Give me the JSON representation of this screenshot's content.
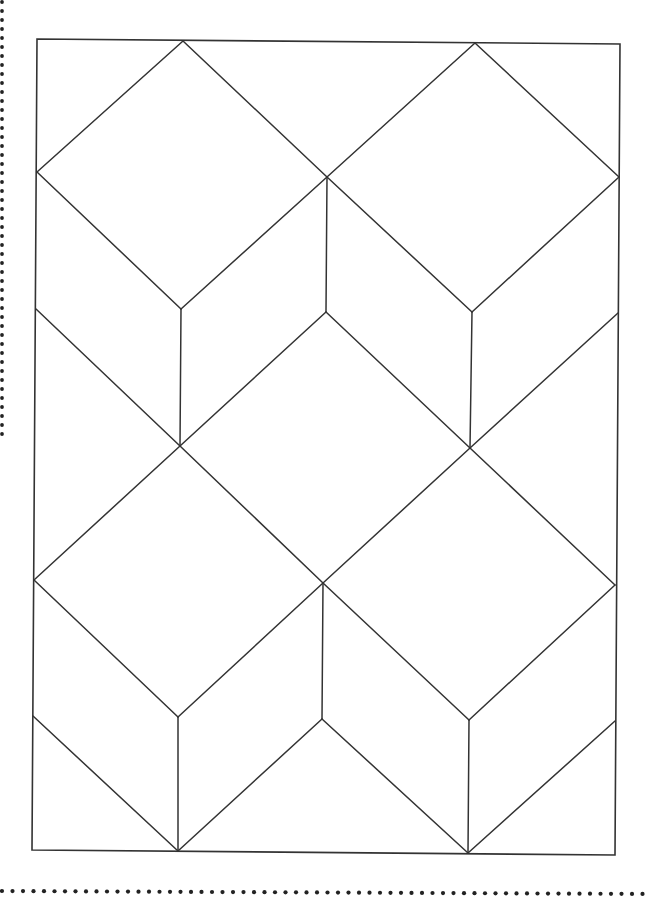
{
  "diagram": {
    "title": "Tumbling blocks quilt pattern",
    "type": "geometric-line-drawing",
    "stroke_color": "#333333",
    "dot_color": "#222222",
    "background": "#ffffff",
    "frame": {
      "top_left": [
        37,
        39
      ],
      "top_right": [
        620,
        44
      ],
      "bottom_right": [
        615,
        855
      ],
      "bottom_left": [
        32,
        850
      ]
    },
    "cube_count": 5,
    "cut_lines": {
      "left_dotted_edge": {
        "x": 2,
        "y_start": 2,
        "y_end": 440,
        "spacing": 9
      },
      "bottom_dotted_edge": {
        "y": 891,
        "x_start": 2,
        "x_end": 648,
        "spacing": 10.5
      }
    },
    "segments": [
      [
        [
          183,
          41
        ],
        [
          37,
          172
        ]
      ],
      [
        [
          183,
          41
        ],
        [
          327,
          177
        ]
      ],
      [
        [
          475,
          43
        ],
        [
          327,
          177
        ]
      ],
      [
        [
          475,
          43
        ],
        [
          619,
          177
        ]
      ],
      [
        [
          37,
          172
        ],
        [
          181,
          309
        ]
      ],
      [
        [
          327,
          177
        ],
        [
          181,
          309
        ]
      ],
      [
        [
          327,
          177
        ],
        [
          472,
          312
        ]
      ],
      [
        [
          619,
          177
        ],
        [
          472,
          312
        ]
      ],
      [
        [
          327,
          177
        ],
        [
          326,
          312
        ]
      ],
      [
        [
          181,
          309
        ],
        [
          180,
          446
        ]
      ],
      [
        [
          472,
          312
        ],
        [
          470,
          448
        ]
      ],
      [
        [
          36,
          309
        ],
        [
          180,
          446
        ]
      ],
      [
        [
          326,
          312
        ],
        [
          180,
          446
        ]
      ],
      [
        [
          326,
          312
        ],
        [
          470,
          448
        ]
      ],
      [
        [
          618,
          313
        ],
        [
          470,
          448
        ]
      ],
      [
        [
          180,
          446
        ],
        [
          34,
          580
        ]
      ],
      [
        [
          180,
          446
        ],
        [
          323,
          583
        ]
      ],
      [
        [
          470,
          448
        ],
        [
          323,
          583
        ]
      ],
      [
        [
          470,
          448
        ],
        [
          615,
          585
        ]
      ],
      [
        [
          34,
          580
        ],
        [
          178,
          717
        ]
      ],
      [
        [
          323,
          583
        ],
        [
          178,
          717
        ]
      ],
      [
        [
          323,
          583
        ],
        [
          469,
          720
        ]
      ],
      [
        [
          615,
          585
        ],
        [
          469,
          720
        ]
      ],
      [
        [
          323,
          583
        ],
        [
          322,
          719
        ]
      ],
      [
        [
          178,
          717
        ],
        [
          178,
          851
        ]
      ],
      [
        [
          469,
          720
        ],
        [
          468,
          853
        ]
      ],
      [
        [
          33,
          716
        ],
        [
          178,
          851
        ]
      ],
      [
        [
          322,
          719
        ],
        [
          178,
          851
        ]
      ],
      [
        [
          322,
          719
        ],
        [
          468,
          853
        ]
      ],
      [
        [
          615,
          721
        ],
        [
          468,
          853
        ]
      ]
    ]
  }
}
